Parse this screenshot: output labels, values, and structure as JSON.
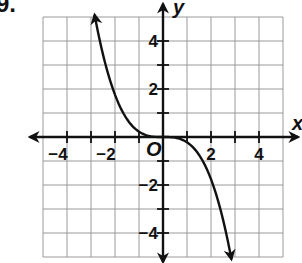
{
  "problem_number": "9.",
  "chart_data": {
    "type": "line",
    "title": "",
    "xlabel": "x",
    "ylabel": "y",
    "origin_label": "O",
    "xlim": [
      -5,
      5
    ],
    "ylim": [
      -5,
      5
    ],
    "grid": true,
    "x_ticks": [
      -4,
      -2,
      2,
      4
    ],
    "y_ticks": [
      4,
      2,
      -2,
      -4
    ],
    "x_tick_labels": [
      "−4",
      "−2",
      "2",
      "4"
    ],
    "y_tick_labels": [
      "4",
      "2",
      "−2",
      "−4"
    ],
    "series": [
      {
        "name": "f(x)",
        "description": "cubic-like curve y ≈ -0.22x³ with arrowheads at both ends",
        "x": [
          -2.85,
          -2.5,
          -2,
          -1.5,
          -1,
          -0.5,
          0,
          0.5,
          1,
          1.5,
          2,
          2.5,
          2.85
        ],
        "y": [
          5.1,
          3.44,
          1.76,
          0.74,
          0.22,
          0.03,
          0,
          -0.03,
          -0.22,
          -0.74,
          -1.76,
          -3.44,
          -5.1
        ]
      }
    ],
    "colors": {
      "grid": "#9a9a9a",
      "axes": "#111111",
      "curve": "#111111"
    }
  }
}
